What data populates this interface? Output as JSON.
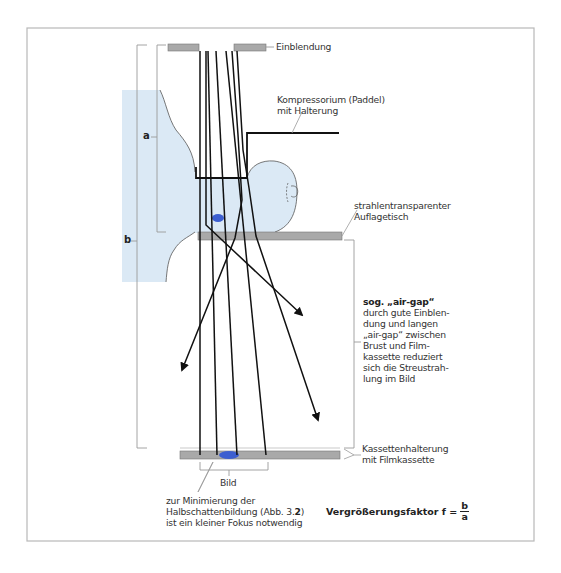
{
  "figure": {
    "colors": {
      "frame": "#b8b8b8",
      "breast_fill": "#dbe9f5",
      "plate_fill": "#a9a9a9",
      "focus_blue": "#3d5fd0",
      "beam": "#111111",
      "leader": "#9a9a9a"
    }
  },
  "labels": {
    "collimator": "Einblendung",
    "compressor_line1": "Kompressorium (Paddel)",
    "compressor_line2": "mit Halterung",
    "table_line1": "strahlentransparenter",
    "table_line2": "Auflagetisch",
    "airgap_title": "sog. „air-gap“",
    "airgap_lines": [
      "durch gute Einblen-",
      "dung und langen",
      "„air-gap“ zwischen",
      "Brust und Film-",
      "kassette reduziert",
      "sich die Streustrah-",
      "lung im Bild"
    ],
    "cassette_line1": "Kassettenhalterung",
    "cassette_line2": "mit Filmkassette",
    "image": "Bild",
    "focus_line1": "zur Minimierung der",
    "focus_line2_pre": "Halbschattenbildung (Abb. 3.",
    "focus_line2_bold": "2",
    "focus_line2_post": ")",
    "focus_line3": "ist ein kleiner Fokus notwendig",
    "dim_a": "a",
    "dim_b": "b",
    "formula_prefix": "Vergrößerungsfaktor f =",
    "formula_num": "b",
    "formula_den": "a"
  }
}
